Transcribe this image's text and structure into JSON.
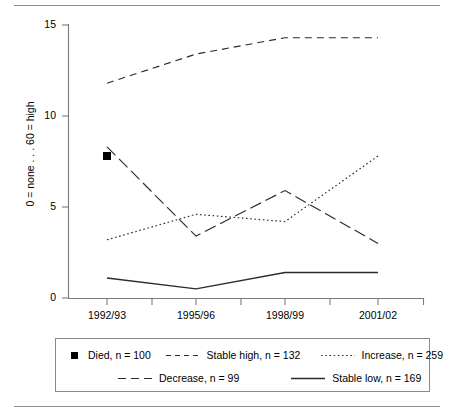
{
  "chart_data": {
    "type": "line",
    "title": "",
    "xlabel": "",
    "ylabel": "0 = none ... 60 = high",
    "categories": [
      "1992/93",
      "1995/96",
      "1998/99",
      "2001/02"
    ],
    "ylim": [
      0,
      15
    ],
    "yticks": [
      0,
      5,
      10,
      15
    ],
    "grid": false,
    "legend_position": "bottom",
    "series": [
      {
        "name": "Died, n = 100",
        "label": "Died",
        "n": 100,
        "style": "marker-only",
        "marker": "filled-square",
        "values": [
          7.8,
          null,
          null,
          null
        ]
      },
      {
        "name": "Stable high, n = 132",
        "label": "Stable high",
        "n": 132,
        "style": "dashed",
        "values": [
          11.8,
          13.4,
          14.3,
          14.3
        ]
      },
      {
        "name": "Increase, n = 259",
        "label": "Increase",
        "n": 259,
        "style": "dotted",
        "values": [
          3.2,
          4.6,
          4.2,
          7.8
        ]
      },
      {
        "name": "Decrease, n = 99",
        "label": "Decrease",
        "n": 99,
        "style": "dash-dot",
        "values": [
          8.3,
          3.4,
          5.9,
          3.0
        ]
      },
      {
        "name": "Stable low, n = 169",
        "label": "Stable low",
        "n": 169,
        "style": "solid",
        "values": [
          1.1,
          0.5,
          1.4,
          1.4
        ]
      }
    ]
  },
  "axis": {
    "y_title": "0 = none . . . 60 = high",
    "y_ticks": [
      "15",
      "10",
      "5",
      "0"
    ],
    "x_ticks": [
      "1992/93",
      "1995/96",
      "1998/99",
      "2001/02"
    ]
  },
  "legend": {
    "row1": [
      {
        "label": "Died, n = 100"
      },
      {
        "label": "Stable high, n = 132"
      },
      {
        "label": "Increase, n = 259"
      }
    ],
    "row2": [
      {
        "label": "Decrease, n = 99"
      },
      {
        "label": "Stable low, n = 169"
      }
    ]
  },
  "colors": {
    "ink": "#1a1a1a",
    "axis": "#7a7a7a",
    "rule": "#8e8e8e",
    "legend_border": "#8a8a8a"
  }
}
